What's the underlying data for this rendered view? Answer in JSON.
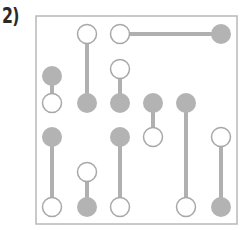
{
  "puzzle": {
    "label": "2)",
    "colors": {
      "frame": "#b8b8b8",
      "link": "#b0b0b0",
      "filled": "#b3b3b3",
      "hollow_fill": "#ffffff",
      "hollow_stroke": "#a8a8a8"
    },
    "frame": {
      "x": 36,
      "y": 16,
      "w": 201,
      "h": 208
    },
    "links": [
      {
        "x1": 120,
        "y1": 34,
        "x2": 221,
        "y2": 34
      },
      {
        "x1": 87,
        "y1": 34,
        "x2": 87,
        "y2": 103
      },
      {
        "x1": 120,
        "y1": 69,
        "x2": 120,
        "y2": 103
      },
      {
        "x1": 52,
        "y1": 76,
        "x2": 52,
        "y2": 103
      },
      {
        "x1": 153,
        "y1": 103,
        "x2": 153,
        "y2": 137
      },
      {
        "x1": 186,
        "y1": 103,
        "x2": 186,
        "y2": 207
      },
      {
        "x1": 52,
        "y1": 137,
        "x2": 52,
        "y2": 207
      },
      {
        "x1": 120,
        "y1": 137,
        "x2": 120,
        "y2": 207
      },
      {
        "x1": 87,
        "y1": 172,
        "x2": 87,
        "y2": 207
      },
      {
        "x1": 221,
        "y1": 137,
        "x2": 221,
        "y2": 207
      }
    ],
    "nodes": [
      {
        "x": 87,
        "y": 34,
        "type": "hollow"
      },
      {
        "x": 120,
        "y": 34,
        "type": "hollow"
      },
      {
        "x": 221,
        "y": 34,
        "type": "filled"
      },
      {
        "x": 120,
        "y": 69,
        "type": "hollow"
      },
      {
        "x": 52,
        "y": 76,
        "type": "filled"
      },
      {
        "x": 52,
        "y": 103,
        "type": "hollow"
      },
      {
        "x": 87,
        "y": 103,
        "type": "filled"
      },
      {
        "x": 120,
        "y": 103,
        "type": "filled"
      },
      {
        "x": 153,
        "y": 103,
        "type": "filled"
      },
      {
        "x": 186,
        "y": 103,
        "type": "filled"
      },
      {
        "x": 52,
        "y": 137,
        "type": "filled"
      },
      {
        "x": 120,
        "y": 137,
        "type": "filled"
      },
      {
        "x": 153,
        "y": 137,
        "type": "hollow"
      },
      {
        "x": 221,
        "y": 137,
        "type": "hollow"
      },
      {
        "x": 87,
        "y": 172,
        "type": "hollow"
      },
      {
        "x": 52,
        "y": 207,
        "type": "hollow"
      },
      {
        "x": 87,
        "y": 207,
        "type": "filled"
      },
      {
        "x": 120,
        "y": 207,
        "type": "hollow"
      },
      {
        "x": 186,
        "y": 207,
        "type": "hollow"
      },
      {
        "x": 221,
        "y": 207,
        "type": "filled"
      }
    ]
  }
}
